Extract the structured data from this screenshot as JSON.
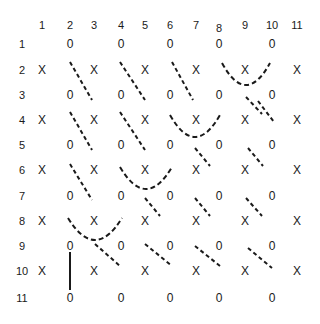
{
  "diagram": {
    "col_labels": [
      "1",
      "2",
      "3",
      "4",
      "5",
      "6",
      "7",
      "8",
      "9",
      "10",
      "11"
    ],
    "row_labels": [
      "1",
      "2",
      "3",
      "4",
      "5",
      "6",
      "7",
      "8",
      "9",
      "10",
      "11"
    ],
    "col_x": [
      42,
      70,
      94,
      121,
      145,
      170,
      196,
      219,
      245,
      272,
      297
    ],
    "row_y": [
      44,
      70,
      95,
      120,
      145,
      170,
      196,
      221,
      246,
      271,
      298
    ],
    "header_y": 25,
    "row_label_x": 22,
    "zero_symbol": "0",
    "x_symbol": "X",
    "zero_rows": [
      1,
      3,
      5,
      7,
      9,
      11
    ],
    "zero_cols": [
      2,
      4,
      6,
      8,
      10
    ],
    "x_rows": [
      2,
      4,
      6,
      8,
      10
    ],
    "x_cols": [
      1,
      3,
      5,
      7,
      9,
      11
    ],
    "dashed_segments": [
      [
        70,
        62,
        92,
        100
      ],
      [
        120,
        62,
        145,
        100
      ],
      [
        172,
        62,
        193,
        100
      ],
      [
        246,
        97,
        262,
        114
      ],
      [
        70,
        112,
        92,
        150
      ],
      [
        120,
        112,
        145,
        150
      ],
      [
        258,
        101,
        274,
        122
      ],
      [
        195,
        148,
        210,
        166
      ],
      [
        248,
        148,
        263,
        166
      ],
      [
        70,
        164,
        92,
        200
      ],
      [
        145,
        198,
        160,
        216
      ],
      [
        195,
        198,
        210,
        216
      ],
      [
        246,
        198,
        262,
        216
      ],
      [
        95,
        244,
        120,
        266
      ],
      [
        145,
        244,
        172,
        266
      ],
      [
        195,
        246,
        220,
        266
      ],
      [
        248,
        248,
        272,
        268
      ]
    ],
    "arcs": [
      {
        "x1": 222,
        "y1": 63,
        "x2": 270,
        "y2": 63,
        "depth": 22
      },
      {
        "x1": 170,
        "y1": 115,
        "x2": 220,
        "y2": 115,
        "depth": 22
      },
      {
        "x1": 120,
        "y1": 167,
        "x2": 172,
        "y2": 167,
        "depth": 22
      },
      {
        "x1": 68,
        "y1": 218,
        "x2": 122,
        "y2": 218,
        "depth": 22
      }
    ],
    "solid_segments": [
      [
        70,
        252,
        70,
        290
      ]
    ],
    "ink_color": "#1a1a1a"
  }
}
